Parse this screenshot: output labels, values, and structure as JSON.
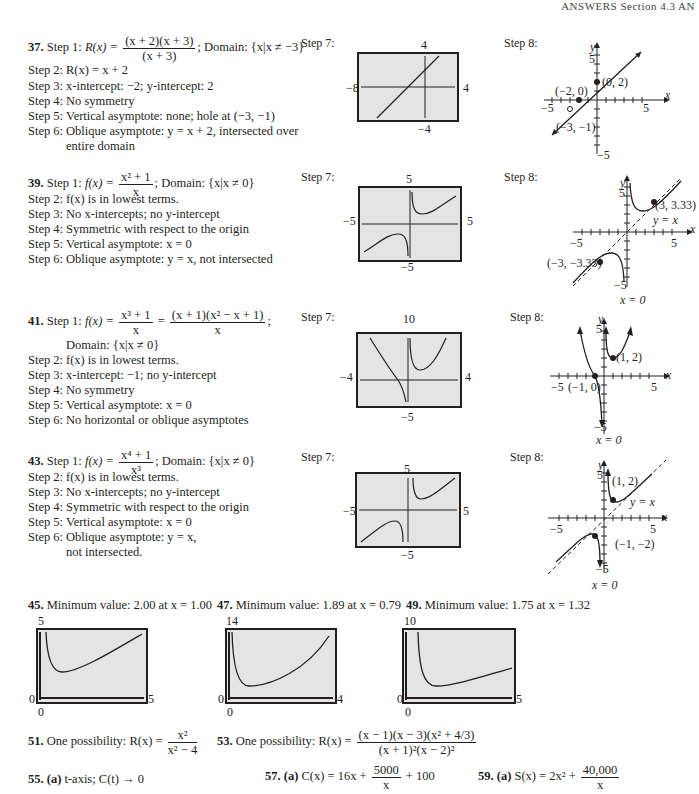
{
  "header": {
    "text": "ANSWERS  Section 4.3   AN"
  },
  "problems": [
    {
      "number": "37.",
      "step1_label": "Step 1:",
      "step1_lhs": "R(x) =",
      "step1_num": "(x + 2)(x + 3)",
      "step1_den": "(x + 3)",
      "step1_rest": "; Domain: {x|x ≠ −3}",
      "steps": [
        {
          "label": "Step 2:",
          "text": "R(x) = x + 2"
        },
        {
          "label": "Step 3:",
          "text": "x-intercept: −2; y-intercept: 2"
        },
        {
          "label": "Step 4:",
          "text": "No symmetry"
        },
        {
          "label": "Step 5:",
          "text": "Vertical asymptote: none; hole at (−3, −1)"
        },
        {
          "label": "Step 6:",
          "text": "Oblique asymptote: y = x + 2, intersected over"
        },
        {
          "label": "",
          "text": "entire domain"
        }
      ],
      "step7_label": "Step 7:",
      "step7_window": {
        "top": "4",
        "bottom": "−4",
        "left": "−8",
        "right": "4"
      },
      "step8_label": "Step 8:",
      "step8_points": [
        "(−2, 0)",
        "(0, 2)",
        "(−3, −1)"
      ],
      "step8_axes": {
        "y": "y",
        "x": "x",
        "ytop": "5",
        "ybottom": "−5",
        "xleft": "−5",
        "xright": "5"
      }
    },
    {
      "number": "39.",
      "step1_label": "Step 1:",
      "step1_lhs": "f(x) =",
      "step1_num": "x² + 1",
      "step1_den": "x",
      "step1_rest": "; Domain: {x|x ≠ 0}",
      "steps": [
        {
          "label": "Step 2:",
          "text": "f(x) is in lowest terms."
        },
        {
          "label": "Step 3:",
          "text": "No x-intercepts; no y-intercept"
        },
        {
          "label": "Step 4:",
          "text": "Symmetric with respect to the origin"
        },
        {
          "label": "Step 5:",
          "text": "Vertical asymptote: x = 0"
        },
        {
          "label": "Step 6:",
          "text": "Oblique asymptote: y = x, not intersected"
        }
      ],
      "step7_label": "Step 7:",
      "step7_window": {
        "top": "5",
        "bottom": "−5",
        "left": "−5",
        "right": "5"
      },
      "step8_label": "Step 8:",
      "step8_points": [
        "(3, 3.33)",
        "(−3, −3.33)"
      ],
      "step8_asymptotes": [
        "y = x",
        "x = 0"
      ],
      "step8_axes": {
        "y": "y",
        "x": "x",
        "ytop": "5",
        "ybottom": "−5",
        "xleft": "−5",
        "xright": "5"
      }
    },
    {
      "number": "41.",
      "step1_label": "Step 1:",
      "step1_lhs": "f(x) =",
      "step1_num": "x³ + 1",
      "step1_den": "x",
      "step1_eq2_num": "(x + 1)(x² − x + 1)",
      "step1_eq2_den": "x",
      "step1_rest": ";",
      "step1_domain": "Domain: {x|x ≠ 0}",
      "steps": [
        {
          "label": "Step 2:",
          "text": "f(x) is in lowest terms."
        },
        {
          "label": "Step 3:",
          "text": "x-intercept: −1; no y-intercept"
        },
        {
          "label": "Step 4:",
          "text": "No symmetry"
        },
        {
          "label": "Step 5:",
          "text": "Vertical asymptote: x = 0"
        },
        {
          "label": "Step 6:",
          "text": "No horizontal or oblique asymptotes"
        }
      ],
      "step7_label": "Step 7:",
      "step7_window": {
        "top": "10",
        "bottom": "−5",
        "left": "−4",
        "right": "4"
      },
      "step8_label": "Step 8:",
      "step8_points": [
        "(1, 2)",
        "(−1, 0)"
      ],
      "step8_asymptotes": [
        "x = 0"
      ],
      "step8_axes": {
        "y": "y",
        "x": "x",
        "ytop": "5",
        "ybottom": "−5",
        "xleft": "−5",
        "xright": "5"
      }
    },
    {
      "number": "43.",
      "step1_label": "Step 1:",
      "step1_lhs": "f(x) =",
      "step1_num": "x⁴ + 1",
      "step1_den": "x³",
      "step1_rest": "; Domain: {x|x ≠ 0}",
      "steps": [
        {
          "label": "Step 2:",
          "text": "f(x) is in lowest terms."
        },
        {
          "label": "Step 3:",
          "text": "No x-intercepts; no y-intercept"
        },
        {
          "label": "Step 4:",
          "text": "Symmetric with respect to the origin"
        },
        {
          "label": "Step 5:",
          "text": "Vertical asymptote: x = 0"
        },
        {
          "label": "Step 6:",
          "text": "Oblique asymptote: y = x,"
        },
        {
          "label": "",
          "text": "not intersected."
        }
      ],
      "step7_label": "Step 7:",
      "step7_window": {
        "top": "5",
        "bottom": "−5",
        "left": "−5",
        "right": "5"
      },
      "step8_label": "Step 8:",
      "step8_points": [
        "(1, 2)",
        "(−1, −2)"
      ],
      "step8_asymptotes": [
        "y = x",
        "x = 0"
      ],
      "step8_axes": {
        "y": "y",
        "x": "x",
        "ytop": "5",
        "ybottom": "−5",
        "xleft": "−5",
        "xright": "5"
      }
    }
  ],
  "minimums": [
    {
      "number": "45.",
      "text": "Minimum value: 2.00 at x = 1.00",
      "window": {
        "top": "5",
        "left": "0",
        "right": "5",
        "bottom": "0"
      }
    },
    {
      "number": "47.",
      "text": "Minimum value: 1.89 at x = 0.79",
      "window": {
        "top": "14",
        "left": "0",
        "right": "4",
        "bottom": "0"
      }
    },
    {
      "number": "49.",
      "text": "Minimum value: 1.75 at x = 1.32",
      "window": {
        "top": "10",
        "left": "0",
        "right": "5",
        "bottom": "0"
      }
    }
  ],
  "p51": {
    "number": "51.",
    "prefix": "One possibility: R(x) =",
    "num": "x²",
    "den": "x² − 4"
  },
  "p53": {
    "number": "53.",
    "prefix": "One possibility: R(x) =",
    "num": "(x − 1)(x − 3)(x² + 4/3)",
    "den": "(x + 1)²(x − 2)²"
  },
  "p55": {
    "number": "55.",
    "part": "(a)",
    "text": "t-axis; C(t) → 0"
  },
  "p57": {
    "number": "57.",
    "part": "(a)",
    "prefix": "C(x) = 16x +",
    "num": "5000",
    "den": "x",
    "suffix": "+ 100"
  },
  "p59": {
    "number": "59.",
    "part": "(a)",
    "prefix": "S(x) = 2x² +",
    "num": "40,000",
    "den": "x"
  }
}
